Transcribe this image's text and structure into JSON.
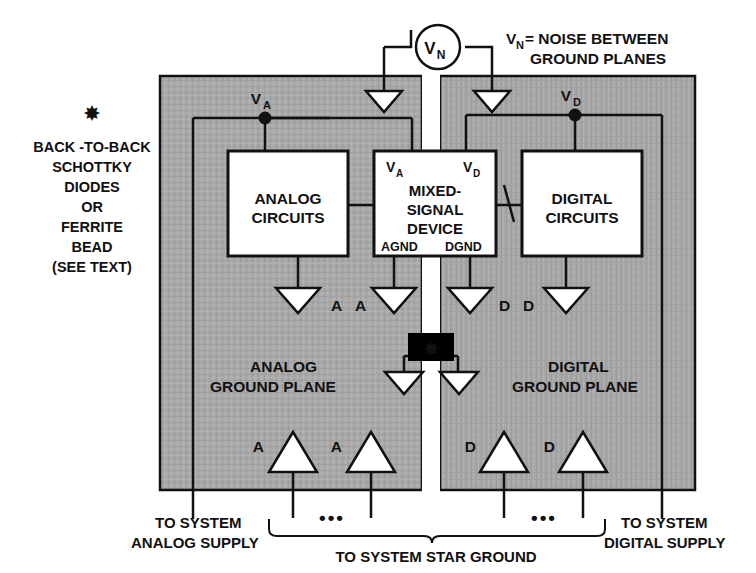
{
  "diagram": {
    "colors": {
      "plane_fill": "#a8a8a8",
      "line": "#111111",
      "block_fill": "#ffffff",
      "star_box_fill": "#000000",
      "star_glyph": "#ffffff",
      "background": "#ffffff"
    },
    "notes": {
      "noise_label_line1": "V",
      "noise_label_sub": "N",
      "noise_label_line1_rest": "= NOISE BETWEEN",
      "noise_label_line2": "GROUND PLANES",
      "asterisk_glyph": "✸",
      "footnote": [
        "BACK -TO-BACK",
        "SCHOTTKY",
        "DIODES",
        "OR",
        "FERRITE",
        "BEAD",
        "(SEE TEXT)"
      ]
    },
    "meter": {
      "label": "V",
      "sub": "N"
    },
    "blocks": [
      {
        "id": "analog-circuits",
        "line1": "ANALOG",
        "line2": "CIRCUITS"
      },
      {
        "id": "mixed-signal-device",
        "line1": "MIXED-",
        "line2": "SIGNAL",
        "line3": "DEVICE"
      },
      {
        "id": "digital-circuits",
        "line1": "DIGITAL",
        "line2": "CIRCUITS"
      }
    ],
    "device_pins": {
      "supply_analog": "V",
      "supply_analog_sub": "A",
      "supply_digital": "V",
      "supply_digital_sub": "D",
      "gnd_analog": "AGND",
      "gnd_digital": "DGND"
    },
    "nodes": [
      {
        "id": "node-va",
        "label": "V",
        "sub": "A"
      },
      {
        "id": "node-vd",
        "label": "V",
        "sub": "D"
      }
    ],
    "plane_labels": {
      "analog_line1": "ANALOG",
      "analog_line2": "GROUND PLANE",
      "digital_line1": "DIGITAL",
      "digital_line2": "GROUND PLANE"
    },
    "ground_symbol_labels": {
      "mid_row": [
        "A",
        "A",
        "D",
        "D"
      ],
      "bottom_row": [
        "A",
        "A",
        "D",
        "D"
      ]
    },
    "bottom_labels": {
      "left_line1": "TO SYSTEM",
      "left_line2": "ANALOG SUPPLY",
      "right_line1": "TO SYSTEM",
      "right_line2": "DIGITAL SUPPLY",
      "center": "TO SYSTEM STAR GROUND",
      "ellipsis": "•••"
    }
  }
}
